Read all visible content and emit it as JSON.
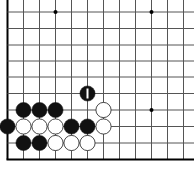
{
  "diagram": {
    "type": "go-board-corner",
    "grid": {
      "x_lines": [
        7.5,
        23.5,
        39.5,
        55.5,
        71.5,
        87.5,
        103.5,
        119.5,
        135.5,
        151.5,
        167.5,
        183.5
      ],
      "y_lines": [
        12,
        28.5,
        45,
        61,
        77,
        93.5,
        110,
        126.5,
        143
      ],
      "bottom_edge_y": 159.5,
      "left_edge_x": 7.5,
      "line_color": "#555555",
      "edge_color": "#000000"
    },
    "star_points": [
      [
        55.5,
        12
      ],
      [
        151.5,
        12
      ],
      [
        151.5,
        110
      ]
    ],
    "stones": [
      {
        "color": "black",
        "col": 5,
        "row": 5,
        "mark": "1"
      },
      {
        "color": "black",
        "col": 1,
        "row": 6
      },
      {
        "color": "black",
        "col": 2,
        "row": 6
      },
      {
        "color": "black",
        "col": 3,
        "row": 6
      },
      {
        "color": "white",
        "col": 6,
        "row": 6
      },
      {
        "color": "black",
        "col": 0,
        "row": 7
      },
      {
        "color": "white",
        "col": 1,
        "row": 7
      },
      {
        "color": "white",
        "col": 2,
        "row": 7
      },
      {
        "color": "white",
        "col": 3,
        "row": 7
      },
      {
        "color": "black",
        "col": 4,
        "row": 7
      },
      {
        "color": "black",
        "col": 5,
        "row": 7
      },
      {
        "color": "white",
        "col": 6,
        "row": 7
      },
      {
        "color": "black",
        "col": 1,
        "row": 8
      },
      {
        "color": "black",
        "col": 2,
        "row": 8
      },
      {
        "color": "white",
        "col": 3,
        "row": 8
      },
      {
        "color": "white",
        "col": 4,
        "row": 8
      },
      {
        "color": "white",
        "col": 5,
        "row": 8
      }
    ],
    "colors": {
      "black_stone": "#111111",
      "white_stone": "#ffffff",
      "white_stone_stroke": "#333333",
      "mark_on_black": "#ffffff"
    }
  }
}
